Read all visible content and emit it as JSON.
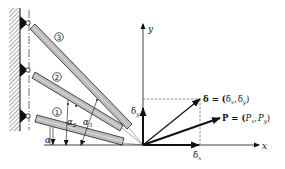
{
  "diagram": {
    "bars": [
      {
        "id": "1",
        "label": "①",
        "angle_label": "α",
        "angle_sub": "1"
      },
      {
        "id": "2",
        "label": "②",
        "angle_label": "α",
        "angle_sub": "2"
      },
      {
        "id": "3",
        "label": "③",
        "angle_label": "α",
        "angle_sub": "3"
      }
    ],
    "axes": {
      "x_label": "x",
      "y_label": "y"
    },
    "displacement": {
      "symbol": "δ",
      "equation": "δ = (δx, δy)",
      "label_lhs": "δ = (",
      "comp_x": "δ",
      "comp_x_sub": "x",
      "comp_y": "δ",
      "comp_y_sub": "y",
      "sep": ",",
      "close": ")"
    },
    "load": {
      "symbol": "P",
      "equation": "P = (Px, Py)",
      "label_lhs": "P = (",
      "comp_x": "P",
      "comp_x_sub": "x",
      "comp_y": "P",
      "comp_y_sub": "y",
      "sep": ",",
      "close": ")"
    },
    "components": {
      "dx_label": "δ",
      "dx_sub": "x",
      "dy_label": "δ",
      "dy_sub": "y"
    },
    "colors": {
      "line": "#111111",
      "bar_fill": "#bdbdbd",
      "bar_stroke": "#222222",
      "hatch": "#555555"
    }
  }
}
